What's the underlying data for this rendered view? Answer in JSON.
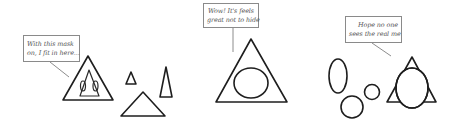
{
  "panels": [
    {
      "name": "masked",
      "bubble": {
        "lines": [
          "With this mask",
          "on, I fit in here..."
        ]
      }
    },
    {
      "name": "unmasked",
      "bubble": {
        "lines": [
          "Wow! It's feels",
          "great not to hide"
        ]
      }
    },
    {
      "name": "hiding",
      "bubble": {
        "lines": [
          "Hope no one",
          "sees the real me"
        ]
      }
    }
  ],
  "colors": {
    "ink": "#1e1e1e",
    "bubble_border": "#8a8a8a",
    "bubble_text": "#555555",
    "background": "#ffffff"
  }
}
